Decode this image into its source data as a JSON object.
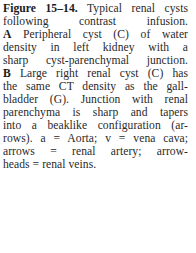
{
  "caption": {
    "figure_label": "Figure 15–14.",
    "lines": [
      " Typical renal cysts",
      "following contrast infusion.",
      " Peripheral cyst (C) of water",
      "density in left kidney with a",
      "sharp cyst-parenchymal junction.",
      " Large right renal cyst (C) has",
      "the same CT density as the gall-",
      "bladder (G). Junction with renal",
      "parenchyma is sharp and tapers",
      "into a beaklike configuration (ar-",
      "rows). a = Aorta; v = vena cava;",
      "arrows = renal artery; arrow-",
      "heads = renal veins."
    ],
    "panel_a": "A",
    "panel_b": "B"
  }
}
